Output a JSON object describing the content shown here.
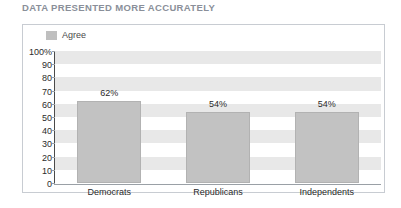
{
  "title": "DATA PRESENTED MORE ACCURATELY",
  "legend": {
    "entries": [
      {
        "label": "Agree",
        "color": "#bfbfbf",
        "icon": "square-swatch-icon"
      }
    ]
  },
  "colors": {
    "bar": "#c2c2c2",
    "band": "#e8e8e8",
    "axis": "#4a4a4a",
    "title": "#8a8f99",
    "frame_border": "#c8ccd2"
  },
  "chart_data": {
    "type": "bar",
    "title": "DATA PRESENTED MORE ACCURATELY",
    "xlabel": "",
    "ylabel": "",
    "ylim": [
      0,
      100
    ],
    "grid": true,
    "legend_position": "top-left",
    "categories": [
      "Democrats",
      "Republicans",
      "Independents"
    ],
    "values": [
      62,
      54,
      54
    ],
    "value_labels": [
      "62%",
      "54%",
      "54%"
    ],
    "ytick_labels": [
      "100%",
      "90",
      "80",
      "70",
      "60",
      "50",
      "40",
      "30",
      "20",
      "10",
      "0"
    ],
    "ytick_values": [
      100,
      90,
      80,
      70,
      60,
      50,
      40,
      30,
      20,
      10,
      0
    ],
    "series": [
      {
        "name": "Agree",
        "values": [
          62,
          54,
          54
        ],
        "color": "#c2c2c2"
      }
    ]
  }
}
